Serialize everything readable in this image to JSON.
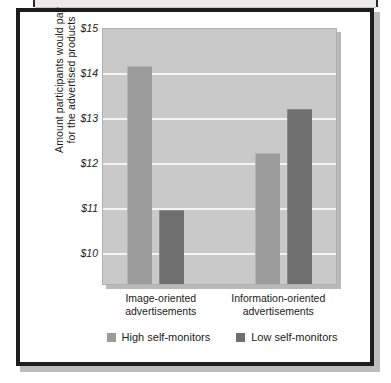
{
  "chart_data": {
    "type": "bar",
    "title": "",
    "xlabel": "",
    "ylabel": "Amount participants would pay for the advertised products",
    "ylabel_lines": [
      "Amount participants would pay",
      "for the advertised products"
    ],
    "categories": [
      "Image-oriented advertisements",
      "Information-oriented advertisements"
    ],
    "category_lines": [
      [
        "Image-oriented",
        "advertisements"
      ],
      [
        "Information-oriented",
        "advertisements"
      ]
    ],
    "series": [
      {
        "name": "High self-monitors",
        "values": [
          14.15,
          12.3
        ],
        "color": "#9b9b9b"
      },
      {
        "name": "Low self-monitors",
        "values": [
          11.1,
          13.25
        ],
        "color": "#6f6f6f"
      }
    ],
    "ylim": [
      9.55,
      15
    ],
    "yticks": [
      15,
      14,
      13,
      12,
      11,
      10
    ],
    "ytick_labels": [
      "$15",
      "$14",
      "$13",
      "$12",
      "$11",
      "$10"
    ],
    "grid": true,
    "legend_position": "bottom",
    "plot_background": "#c9c9c9",
    "gridline_color": "#f4f4f4"
  },
  "legend": {
    "items": [
      {
        "label": "High self-monitors",
        "color": "#9b9b9b"
      },
      {
        "label": "Low self-monitors",
        "color": "#6f6f6f"
      }
    ]
  }
}
